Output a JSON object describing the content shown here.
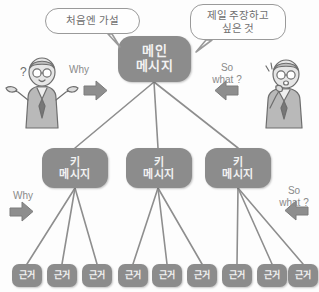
{
  "diagram": {
    "colors": {
      "node_fill": "#8c8c8c",
      "node_text": "#f2f2f2",
      "bubble_stroke": "#9a9a9a",
      "bubble_text": "#6f6f6f",
      "line": "#8e8e8e",
      "background": "#fdfdfd"
    },
    "main_message": {
      "line1": "메인",
      "line2": "메시지"
    },
    "key_messages": [
      {
        "line1": "키",
        "line2": "메시지"
      },
      {
        "line1": "키",
        "line2": "메시지"
      },
      {
        "line1": "키",
        "line2": "메시지"
      }
    ],
    "evidence": [
      {
        "label": "근거"
      },
      {
        "label": "근거"
      },
      {
        "label": "근거"
      },
      {
        "label": "근거"
      },
      {
        "label": "근거"
      },
      {
        "label": "근거"
      },
      {
        "label": "근거"
      },
      {
        "label": "근거"
      },
      {
        "label": "근거"
      }
    ],
    "bubbles": {
      "left": {
        "line1": "처음엔 가설",
        "line2": ""
      },
      "right": {
        "line1": "제일 주장하고",
        "line2": "싶은 것"
      }
    },
    "direction_labels": {
      "why_top": {
        "line1": "Why",
        "line2": ""
      },
      "so_what_top": {
        "line1": "So",
        "line2": "what ?"
      },
      "why_bottom": {
        "line1": "Why",
        "line2": ""
      },
      "so_what_bottom": {
        "line1": "So",
        "line2": "what ?"
      }
    },
    "characters": {
      "left": {
        "name": "shrugging-man",
        "marker": "?"
      },
      "right": {
        "name": "thinking-man",
        "marker": ""
      }
    }
  }
}
